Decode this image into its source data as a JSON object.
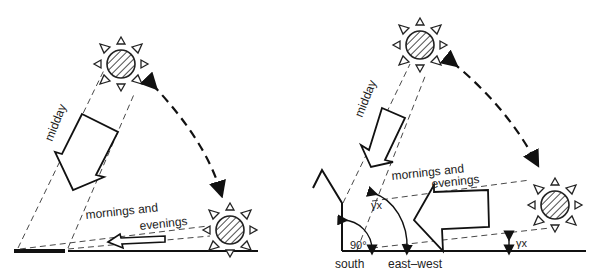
{
  "left_panel": {
    "label_midday": "midday",
    "label_mornings": "mornings and",
    "label_evenings": "evenings"
  },
  "right_panel": {
    "label_midday": "midday",
    "label_mornings": "mornings and",
    "label_evenings": "evenings",
    "angle_90": "90°",
    "angle_gamma_upper": "γx",
    "angle_gamma_lower": "γx",
    "label_south": "south",
    "label_east_west": "east–west"
  },
  "colors": {
    "ink": "#1a1a1a",
    "background": "#ffffff"
  }
}
